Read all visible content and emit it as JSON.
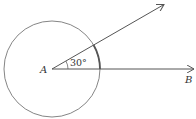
{
  "diagram": {
    "point_a_label": "A",
    "point_b_label": "B",
    "angle_label": "30°",
    "colors": {
      "stroke": "#555555",
      "text": "#333333"
    }
  }
}
